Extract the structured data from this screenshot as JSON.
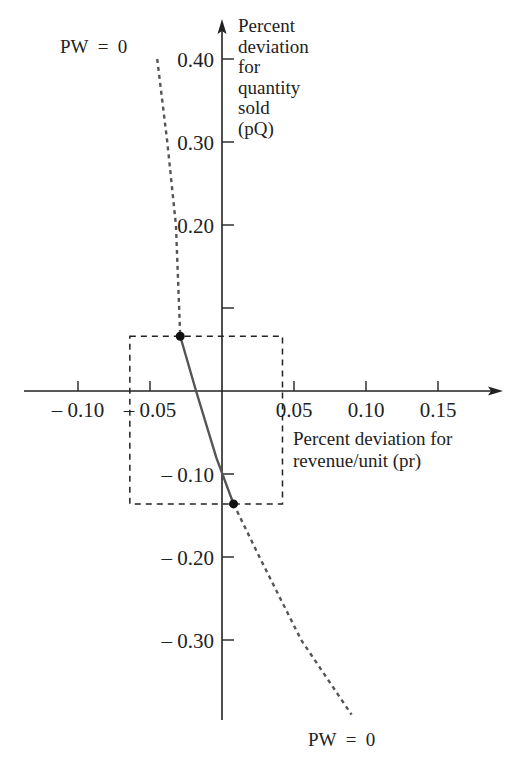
{
  "chart_data": {
    "type": "line",
    "title": "",
    "xlabel_lines": [
      "Percent deviation for",
      "revenue/unit (p_r)"
    ],
    "xlabel": "Percent deviation for revenue/unit (p_r)",
    "ylabel_lines": [
      "Percent",
      "deviation",
      "for",
      "quantity",
      "sold",
      "(p_Q)"
    ],
    "ylabel": "Percent deviation for quantity sold (p_Q)",
    "xlim": [
      -0.15,
      0.19
    ],
    "ylim": [
      -0.4,
      0.45
    ],
    "x_ticks": [
      {
        "value": -0.1,
        "label": "– 0.10"
      },
      {
        "value": -0.05,
        "label": "– 0.05"
      },
      {
        "value": 0.05,
        "label": "0.05"
      },
      {
        "value": 0.1,
        "label": "0.10"
      },
      {
        "value": 0.15,
        "label": "0.15"
      }
    ],
    "y_ticks": [
      {
        "value": 0.4,
        "label": "0.40"
      },
      {
        "value": 0.3,
        "label": "0.30"
      },
      {
        "value": 0.2,
        "label": "0.20"
      },
      {
        "value": 0.1,
        "label": ""
      },
      {
        "value": -0.1,
        "label": "– 0.10"
      },
      {
        "value": -0.2,
        "label": "– 0.20"
      },
      {
        "value": -0.3,
        "label": "– 0.30"
      }
    ],
    "series": [
      {
        "name": "PW = 0",
        "style": "dashed-outside-solid-inside",
        "points": [
          {
            "x": -0.045,
            "y": 0.4
          },
          {
            "x": -0.038,
            "y": 0.3
          },
          {
            "x": -0.032,
            "y": 0.2
          },
          {
            "x": -0.029,
            "y": 0.066
          },
          {
            "x": -0.018,
            "y": 0.0
          },
          {
            "x": -0.004,
            "y": -0.08
          },
          {
            "x": 0.008,
            "y": -0.136
          },
          {
            "x": 0.026,
            "y": -0.2
          },
          {
            "x": 0.055,
            "y": -0.3
          },
          {
            "x": 0.09,
            "y": -0.39
          }
        ],
        "solid_range_y": [
          -0.136,
          0.066
        ]
      }
    ],
    "markers": [
      {
        "x": -0.029,
        "y": 0.066
      },
      {
        "x": 0.008,
        "y": -0.136
      }
    ],
    "region_box": {
      "x_min": -0.064,
      "x_max": 0.042,
      "y_min": -0.136,
      "y_max": 0.066
    },
    "annotations": [
      {
        "text": "PW  =  0",
        "position": "top-left"
      },
      {
        "text": "PW  =  0",
        "position": "bottom-right"
      }
    ],
    "grid": false,
    "legend": "none"
  }
}
